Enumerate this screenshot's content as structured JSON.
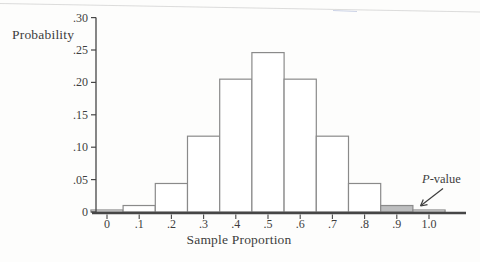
{
  "figure": {
    "ylabel": "Probability",
    "xlabel": "Sample Proportion",
    "annotation": {
      "italic": "P",
      "rest": "-value"
    }
  },
  "chart_data": {
    "type": "bar",
    "title": "",
    "xlabel": "Sample Proportion",
    "ylabel": "Probability",
    "categories": [
      "0",
      ".1",
      ".2",
      ".3",
      ".4",
      ".5",
      ".6",
      ".7",
      ".8",
      ".9",
      "1.0"
    ],
    "values": [
      0.001,
      0.01,
      0.044,
      0.117,
      0.205,
      0.246,
      0.205,
      0.117,
      0.044,
      0.01,
      0.001
    ],
    "ytick_labels": [
      "0",
      ".05",
      ".10",
      ".15",
      ".20",
      ".25",
      ".30"
    ],
    "yticks": [
      0,
      0.05,
      0.1,
      0.15,
      0.2,
      0.25,
      0.3
    ],
    "ylim": [
      0,
      0.3
    ],
    "grid": false,
    "legend": "none",
    "annotation": "P-value",
    "highlighted_category": ".9",
    "colors": {
      "bar_fill": "#ffffff",
      "highlight_fill": "#bdbebf",
      "bar_outline": "#8a8a8a",
      "axis": "#464646",
      "text": "#3d3d3d"
    }
  }
}
